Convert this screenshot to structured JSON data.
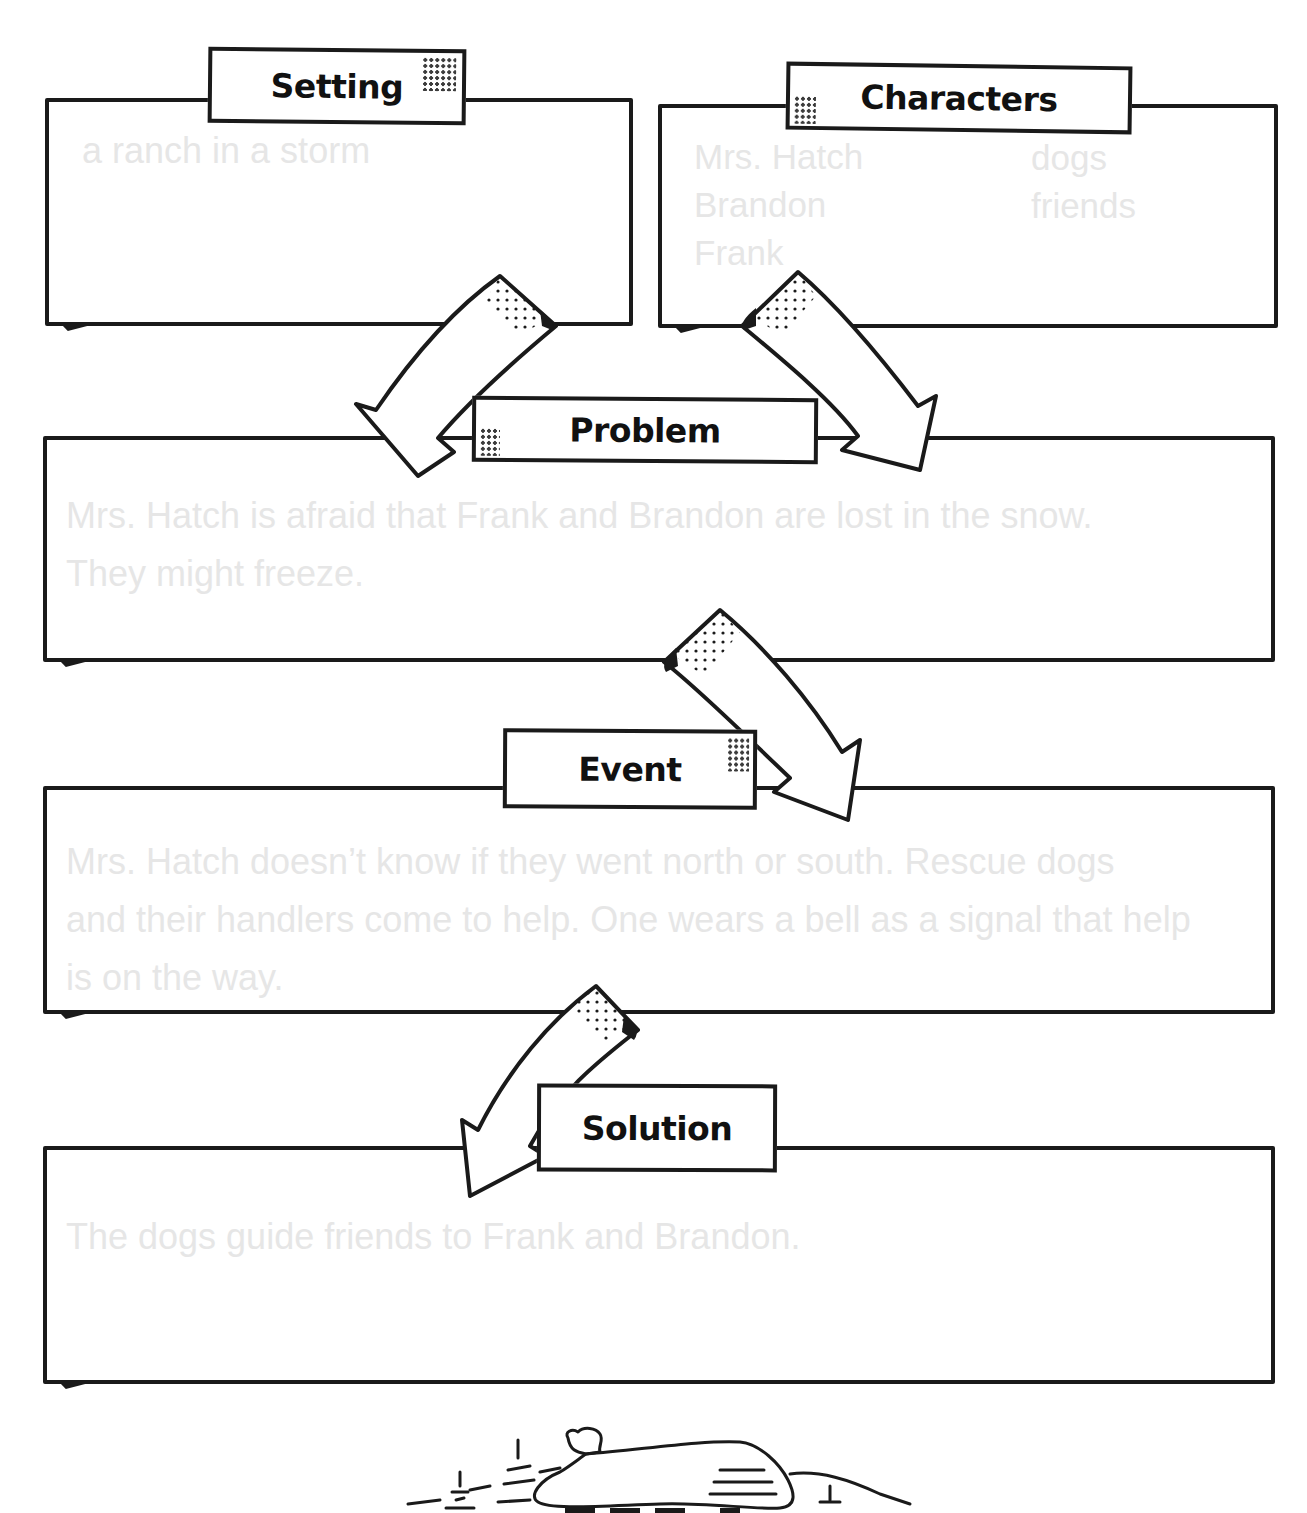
{
  "worksheet": {
    "sections": {
      "setting": {
        "label": "Setting",
        "answer": "a ranch in a storm"
      },
      "characters": {
        "label": "Characters",
        "column_1": [
          "Mrs. Hatch",
          "Brandon",
          "Frank"
        ],
        "column_2": [
          "dogs",
          "friends"
        ]
      },
      "problem": {
        "label": "Problem",
        "answer": "Mrs. Hatch is afraid that Frank and Brandon are lost in the snow.\nThey might freeze."
      },
      "event": {
        "label": "Event",
        "answer": "Mrs. Hatch doesn’t know if they went north or south. Rescue dogs\nand their handlers come to help. One wears a bell as a signal that help\nis on the way."
      },
      "solution": {
        "label": "Solution",
        "answer": "The dogs guide friends to Frank and Brandon."
      }
    },
    "decorations": {
      "arrows": [
        "setting-to-problem",
        "characters-to-problem",
        "problem-to-event",
        "event-to-solution"
      ],
      "footer_illustration": "snowy-log-cabin"
    },
    "colors": {
      "ink": "#1a1a1a",
      "answer_text": "#e6e6e6",
      "background": "#ffffff"
    }
  }
}
